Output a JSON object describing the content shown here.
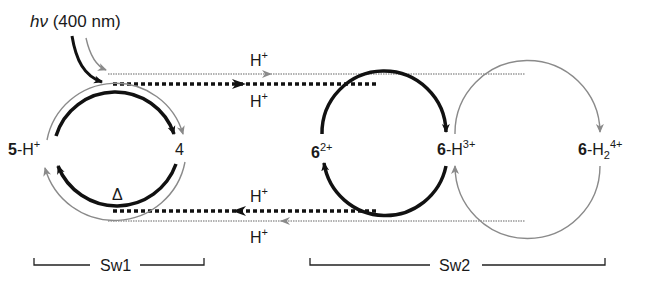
{
  "diagram": {
    "light_label": {
      "hv": "hν",
      "wavelength": "(400 nm)"
    },
    "proton_labels": {
      "top_gray": "H",
      "top_black": "H",
      "bottom_black": "H",
      "bottom_gray": "H",
      "charge": "+"
    },
    "species": {
      "five_h": {
        "num": "5",
        "rest": "-H",
        "charge": "+"
      },
      "four": {
        "num": "4"
      },
      "six": {
        "num": "6",
        "charge": "2+"
      },
      "six_h": {
        "num": "6",
        "rest": "-H",
        "charge": "3+"
      },
      "six_h2": {
        "num": "6",
        "rest": "-H",
        "sub": "2",
        "charge": "4+"
      }
    },
    "heat_label": "Δ",
    "brackets": {
      "sw1": "Sw1",
      "sw2": "Sw2"
    },
    "colors": {
      "black_path": "#111111",
      "gray_path": "#8a8a8a"
    }
  }
}
